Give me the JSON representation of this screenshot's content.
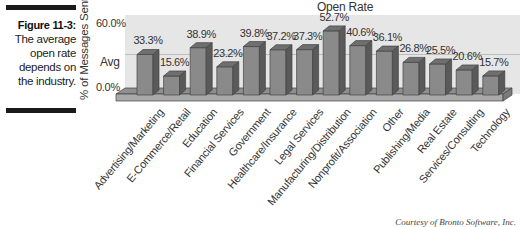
{
  "figure": {
    "label": "Figure 11-3:",
    "caption_lines": [
      "The average",
      "open rate",
      "depends on",
      "the industry."
    ]
  },
  "credit": "Courtesy of Bronto Software, Inc.",
  "colors": {
    "bar_front": "#8a8a8a",
    "bar_top": "#6f6f6f",
    "bar_side": "#5a5a5a",
    "plot_bg": "#e6e6e6",
    "base": "#a8a8a8",
    "avg_line": "#bcbcbc"
  },
  "chart_data": {
    "type": "bar",
    "title": "Open Rate",
    "xlabel": "",
    "ylabel": "% of Messages Sent",
    "ytick_labels": [
      "60.0%",
      "Avg",
      "0.0%"
    ],
    "ylim": [
      0,
      60
    ],
    "avg_value": 30.9,
    "grid": false,
    "three_d": true,
    "legend": null,
    "categories": [
      "Advertising/Marketing",
      "E-Commerce/Retail",
      "Education",
      "Financial Services",
      "Government",
      "Healthcare/Insurance",
      "Legal Services",
      "Manufacturing/Distribution",
      "Nonprofit/Association",
      "Other",
      "Publishing/Media",
      "Real Estate",
      "Services/Consulting",
      "Technology"
    ],
    "values": [
      33.3,
      15.6,
      38.9,
      23.2,
      39.8,
      37.2,
      37.3,
      52.7,
      40.6,
      36.1,
      26.8,
      25.5,
      20.6,
      15.7
    ],
    "value_labels": [
      "33.3%",
      "15.6%",
      "38.9%",
      "23.2%",
      "39.8%",
      "37.2%",
      "37.3%",
      "52.7%",
      "40.6%",
      "36.1%",
      "26.8%",
      "25.5%",
      "20.6%",
      "15.7%"
    ]
  }
}
